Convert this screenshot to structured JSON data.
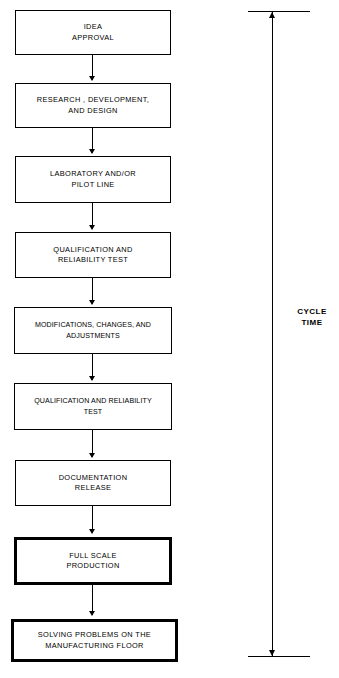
{
  "diagram": {
    "background_color": "#ffffff",
    "line_color": "#000000",
    "nodes": [
      {
        "id": "idea-approval",
        "label": "IDEA\nAPPROVAL",
        "emphasis": "normal"
      },
      {
        "id": "research-development",
        "label": "RESEARCH , DEVELOPMENT,\nAND DESIGN",
        "emphasis": "normal"
      },
      {
        "id": "laboratory-pilot-line",
        "label": "LABORATORY AND/OR\nPILOT LINE",
        "emphasis": "normal"
      },
      {
        "id": "qualification-test-1",
        "label": "QUALIFICATION AND\nRELIABILITY TEST",
        "emphasis": "normal"
      },
      {
        "id": "modifications-changes",
        "label": "MODIFICATIONS, CHANGES, AND\nADJUSTMENTS",
        "emphasis": "normal"
      },
      {
        "id": "qualification-test-2",
        "label": "QUALIFICATION AND RELIABILITY\nTEST",
        "emphasis": "normal"
      },
      {
        "id": "documentation-release",
        "label": "DOCUMENTATION\nRELEASE",
        "emphasis": "normal"
      },
      {
        "id": "full-scale-production",
        "label": "FULL SCALE\nPRODUCTION",
        "emphasis": "bold"
      },
      {
        "id": "solving-problems",
        "label": "SOLVING PROBLEMS ON THE\nMANUFACTURING FLOOR",
        "emphasis": "bold"
      }
    ],
    "cycle_time": {
      "label": "CYCLE\nTIME",
      "annotation_type": "double-headed-vertical-arrow",
      "spans_from": "idea-approval",
      "spans_to": "solving-problems"
    }
  }
}
